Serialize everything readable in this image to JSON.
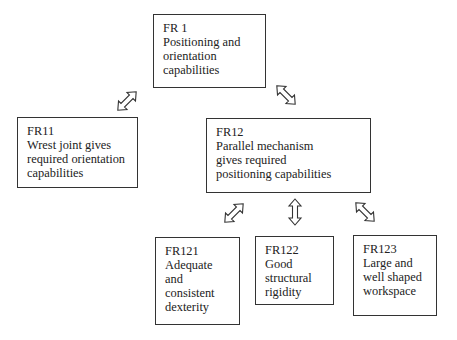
{
  "diagram": {
    "nodes": [
      {
        "id": "FR1",
        "label": "FR 1",
        "lines": [
          "Positioning and",
          "orientation",
          "capabilities"
        ]
      },
      {
        "id": "FR11",
        "label": "FR11",
        "lines": [
          "Wrest joint gives",
          "required orientation",
          "capabilities"
        ]
      },
      {
        "id": "FR12",
        "label": "FR12",
        "lines": [
          "Parallel mechanism",
          "gives required",
          "positioning capabilities"
        ]
      },
      {
        "id": "FR121",
        "label": "FR121",
        "lines": [
          "Adequate",
          "and",
          "consistent",
          "dexterity"
        ]
      },
      {
        "id": "FR122",
        "label": "FR122",
        "lines": [
          "Good",
          "structural",
          "rigidity"
        ]
      },
      {
        "id": "FR123",
        "label": "FR123",
        "lines": [
          "Large and",
          "well shaped",
          "workspace"
        ]
      }
    ],
    "edges": [
      {
        "from": "FR1",
        "to": "FR11",
        "style": "double-headed hollow arrow"
      },
      {
        "from": "FR1",
        "to": "FR12",
        "style": "double-headed hollow arrow"
      },
      {
        "from": "FR12",
        "to": "FR121",
        "style": "double-headed hollow arrow"
      },
      {
        "from": "FR12",
        "to": "FR122",
        "style": "double-headed hollow arrow"
      },
      {
        "from": "FR12",
        "to": "FR123",
        "style": "double-headed hollow arrow"
      }
    ]
  }
}
